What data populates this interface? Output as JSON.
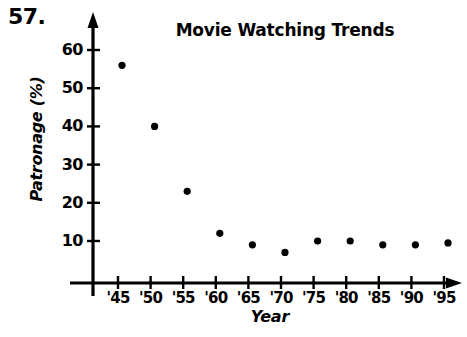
{
  "problem": {
    "number": "57."
  },
  "chart_data": {
    "type": "scatter",
    "title": "Movie Watching Trends",
    "xlabel": "Year",
    "ylabel": "Patronage (%)",
    "categories": [
      "'45",
      "'50",
      "'55",
      "'60",
      "'65",
      "'70",
      "'75",
      "'80",
      "'85",
      "'90",
      "'95"
    ],
    "x": [
      1945,
      1950,
      1955,
      1960,
      1965,
      1970,
      1975,
      1980,
      1985,
      1990,
      1995
    ],
    "values": [
      56,
      40,
      23,
      12,
      9,
      7,
      10,
      10,
      9,
      9,
      9.5
    ],
    "series": [
      {
        "name": "Patronage",
        "values": [
          56,
          40,
          23,
          12,
          9,
          7,
          10,
          10,
          9,
          9,
          9.5
        ]
      }
    ],
    "ytick_labels": [
      "10",
      "20",
      "30",
      "40",
      "50",
      "60"
    ],
    "ytick_values": [
      10,
      20,
      30,
      40,
      50,
      60
    ],
    "xtick_labels": [
      "'45",
      "'50",
      "'55",
      "'60",
      "'65",
      "'70",
      "'75",
      "'80",
      "'85",
      "'90",
      "'95"
    ],
    "ylim": [
      0,
      66
    ],
    "xlim": [
      1942.5,
      1998
    ],
    "grid": false,
    "legend": false,
    "marker_color": "#000000",
    "axis_color": "#000000"
  }
}
